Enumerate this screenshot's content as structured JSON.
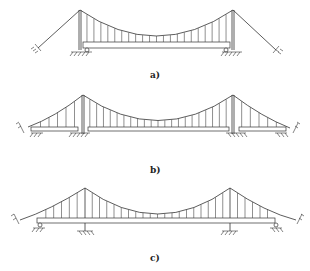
{
  "figure": {
    "panels": [
      {
        "id": "a",
        "label": "a)",
        "scheme": "single-span suspended deck, simply supported between towers"
      },
      {
        "id": "b",
        "label": "b)",
        "scheme": "three-span, separately suspended side spans, simply supported"
      },
      {
        "id": "c",
        "label": "c)",
        "scheme": "three-span continuous deck with suspended side spans"
      }
    ]
  },
  "colors": {
    "line": "#333333",
    "background": "#ffffff"
  }
}
